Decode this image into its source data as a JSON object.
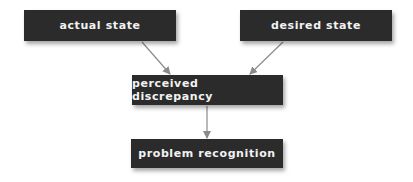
{
  "diagram": {
    "type": "flowchart",
    "nodes": [
      {
        "id": "actual",
        "label": "actual state"
      },
      {
        "id": "desired",
        "label": "desired state"
      },
      {
        "id": "perceived",
        "label": "perceived discrepancy"
      },
      {
        "id": "problem",
        "label": "problem recognition"
      }
    ],
    "edges": [
      {
        "from": "actual",
        "to": "perceived"
      },
      {
        "from": "desired",
        "to": "perceived"
      },
      {
        "from": "perceived",
        "to": "problem"
      }
    ],
    "colors": {
      "box": "#2b2b2b",
      "text": "#f2f2f2",
      "arrow": "#8a8a8a",
      "background": "#ffffff"
    }
  }
}
